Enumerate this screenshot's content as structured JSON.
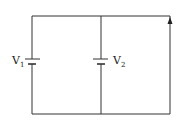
{
  "diagram": {
    "type": "circuit",
    "components": [
      {
        "id": "battery-1",
        "label": "V",
        "subscript": "1",
        "branch": "left"
      },
      {
        "id": "battery-2",
        "label": "V",
        "subscript": "2",
        "branch": "middle"
      }
    ],
    "current_arrow": {
      "branch": "right",
      "direction": "up"
    },
    "stroke_color": "#333333"
  }
}
